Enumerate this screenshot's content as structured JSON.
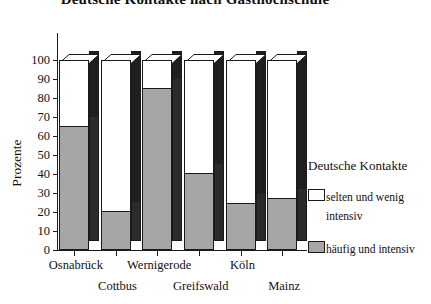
{
  "chart_data": {
    "type": "bar",
    "subtype": "stacked-100-percent-3d",
    "title": "Deutsche Kontakte nach Gasthochschule",
    "xlabel": "",
    "ylabel": "Prozente",
    "ylim": [
      0,
      100
    ],
    "ytick_labels": [
      "0",
      "10",
      "20",
      "30",
      "40",
      "50",
      "60",
      "70",
      "80",
      "90",
      "100"
    ],
    "ytick_values": [
      0,
      10,
      20,
      30,
      40,
      50,
      60,
      70,
      80,
      90,
      100
    ],
    "grid": false,
    "legend_position": "right",
    "legend_title": "Deutsche Kontakte",
    "categories": [
      "Osnabrück",
      "Cottbus",
      "Wernigerode",
      "Greifswald",
      "Köln",
      "Mainz"
    ],
    "series": [
      {
        "name": "häufig und intensiv",
        "color": "#a6a6a6",
        "values": [
          65,
          20,
          85,
          40,
          24,
          27
        ]
      },
      {
        "name": "selten und wenig intensiv",
        "color": "#ffffff",
        "values": [
          35,
          80,
          15,
          60,
          76,
          73
        ]
      }
    ]
  },
  "legend": {
    "title": "Deutsche Kontakte",
    "entries": [
      {
        "label_line1": "selten und wenig",
        "label_line2": "intensiv",
        "swatch": "white"
      },
      {
        "label_line1": "häufig und intensiv",
        "label_line2": "",
        "swatch": "gray"
      }
    ]
  },
  "axis": {
    "y_title": "Prozente"
  }
}
